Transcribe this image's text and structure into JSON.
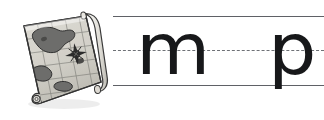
{
  "worksheet": {
    "type": "handwriting-practice-line",
    "background_color": "#ffffff",
    "illustration": {
      "name": "treasure-map-scroll",
      "description": "Rolled parchment treasure map with grid, landmasses and compass rose",
      "style": "grayscale-line-art",
      "parchment_color": "#d9d8d2",
      "ink_color": "#4a4a4a",
      "outline_color": "#2f2f2f",
      "roll_color": "#eceae4",
      "land_color": "#6b6b6b"
    },
    "guide_lines": [
      {
        "name": "top-line",
        "style": "solid",
        "color": "#5f6166"
      },
      {
        "name": "midline",
        "style": "dashed",
        "color": "#6e7176"
      },
      {
        "name": "baseline",
        "style": "solid",
        "color": "#5f6166"
      }
    ],
    "letters": [
      {
        "name": "letter-m",
        "character": "m",
        "case": "lowercase",
        "has_descender": false
      },
      {
        "name": "letter-p",
        "character": "p",
        "case": "lowercase",
        "has_descender": true
      }
    ],
    "letter_color": "#17181a"
  }
}
